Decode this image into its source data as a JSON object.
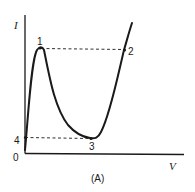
{
  "diagram": {
    "caption": "(A)",
    "axes": {
      "y_label": "I",
      "x_label": "V",
      "origin_label": "0"
    },
    "points": [
      {
        "id": "1",
        "label": "1",
        "description": "peak"
      },
      {
        "id": "2",
        "label": "2",
        "description": "same current as peak on rising branch"
      },
      {
        "id": "3",
        "label": "3",
        "description": "valley"
      },
      {
        "id": "4",
        "label": "4",
        "description": "same current as valley on initial branch"
      }
    ],
    "colors": {
      "stroke": "#1a1a1a",
      "background": "#ffffff"
    }
  }
}
